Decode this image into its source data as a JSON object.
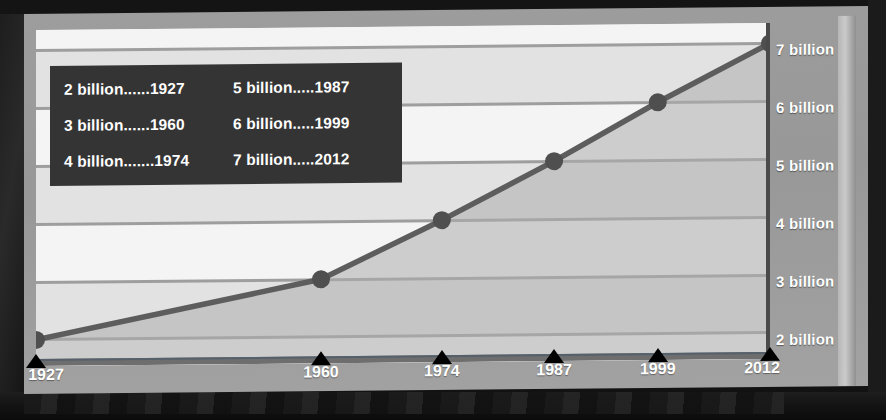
{
  "chart_data": {
    "type": "line",
    "title": "",
    "xlabel": "",
    "ylabel": "",
    "x": [
      1927,
      1960,
      1974,
      1987,
      1999,
      2012
    ],
    "values": [
      2,
      3,
      4,
      5,
      6,
      7
    ],
    "x_tick_labels": [
      "1927",
      "1960",
      "1974",
      "1987",
      "1999",
      "2012"
    ],
    "y_tick_labels": [
      "2 billion",
      "3 billion",
      "4 billion",
      "5 billion",
      "6 billion",
      "7 billion"
    ],
    "y_tick_values": [
      2,
      3,
      4,
      5,
      6,
      7
    ],
    "xlim": [
      1927,
      2012
    ],
    "ylim": [
      1.55,
      7.35
    ],
    "grid": true,
    "legend_position": "top-left",
    "series": [
      {
        "name": "World population",
        "values": [
          2,
          3,
          4,
          5,
          6,
          7
        ]
      }
    ],
    "annotations": []
  },
  "legend": {
    "entries": [
      {
        "label": "2 billion......1927"
      },
      {
        "label": "5 billion.....1987"
      },
      {
        "label": "3 billion......1960"
      },
      {
        "label": "6 billion.....1999"
      },
      {
        "label": "4 billion.......1974"
      },
      {
        "label": "7 billion.....2012"
      }
    ]
  },
  "axes": {
    "y_labels": [
      {
        "text": "7 billion",
        "value": 7
      },
      {
        "text": "6 billion",
        "value": 6
      },
      {
        "text": "5 billion",
        "value": 5
      },
      {
        "text": "4 billion",
        "value": 4
      },
      {
        "text": "3 billion",
        "value": 3
      },
      {
        "text": "2 billion",
        "value": 2
      }
    ],
    "x_labels": [
      {
        "text": "1927",
        "value": 1927
      },
      {
        "text": "1960",
        "value": 1960
      },
      {
        "text": "1974",
        "value": 1974
      },
      {
        "text": "1987",
        "value": 1987
      },
      {
        "text": "1999",
        "value": 1999
      },
      {
        "text": "2012",
        "value": 2012
      }
    ]
  },
  "colors": {
    "slide_background": "#9d9d9d",
    "plot_background": "#f4f4f4",
    "band_light": "#f4f4f4",
    "band_dark": "#e2e2e2",
    "gridline": "#9e9e9e",
    "line": "#5d5d5d",
    "marker": "#4f4f4f",
    "area_fill": "#adadad",
    "legend_background": "#343434",
    "legend_text": "#ffffff",
    "axis_label_text": "#ffffff",
    "tick_marker": "#000000",
    "frame": "#141414"
  }
}
